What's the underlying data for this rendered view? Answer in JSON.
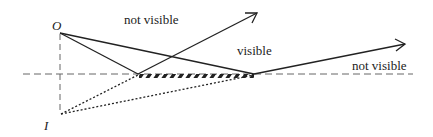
{
  "labels": {
    "object": "O",
    "image": "I",
    "not_visible_top": "not visible",
    "visible": "visible",
    "not_visible_right": "not visible"
  },
  "colors": {
    "ink": "#222222",
    "dashed": "#666666"
  }
}
